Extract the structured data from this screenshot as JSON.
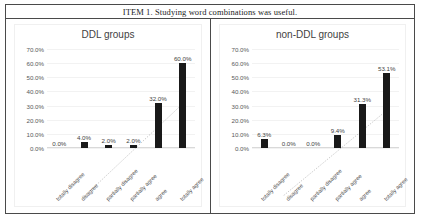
{
  "document": {
    "header_text": "ITEM 1. Studying word combinations was useful."
  },
  "chart_data": [
    {
      "type": "bar",
      "title": "DDL groups",
      "cell": "left",
      "categories": [
        "totally disagree",
        "disagree",
        "partially disagree",
        "partially agree",
        "agree",
        "totally agree"
      ],
      "values": [
        0.0,
        4.0,
        2.0,
        2.0,
        32.0,
        60.0
      ],
      "value_labels": [
        "0.0%",
        "4.0%",
        "2.0%",
        "2.0%",
        "32.0%",
        "60.0%"
      ],
      "ytick_labels": [
        "70.0%",
        "60.0%",
        "50.0%",
        "40.0%",
        "30.0%",
        "20.0%",
        "10.0%",
        "0.0%"
      ],
      "ytick_values": [
        70,
        60,
        50,
        40,
        30,
        20,
        10,
        0
      ],
      "ylim": [
        0,
        70
      ],
      "xlabel": "",
      "ylabel": "",
      "grid": true,
      "legend": "none",
      "bar_color": "#191919",
      "trendline": {
        "style": "dotted",
        "color": "#a6a6a6"
      }
    },
    {
      "type": "bar",
      "title": "non-DDL groups",
      "cell": "right",
      "categories": [
        "totally disagree",
        "disagree",
        "partially disagree",
        "partially agree",
        "agree",
        "totally agree"
      ],
      "values": [
        6.3,
        0.0,
        0.0,
        9.4,
        31.3,
        53.1
      ],
      "value_labels": [
        "6.3%",
        "0.0%",
        "0.0%",
        "9.4%",
        "31.3%",
        "53.1%"
      ],
      "ytick_labels": [
        "70.0%",
        "60.0%",
        "50.0%",
        "40.0%",
        "30.0%",
        "20.0%",
        "10.0%",
        "0.0%"
      ],
      "ytick_values": [
        70,
        60,
        50,
        40,
        30,
        20,
        10,
        0
      ],
      "ylim": [
        0,
        70
      ],
      "xlabel": "",
      "ylabel": "",
      "grid": true,
      "legend": "none",
      "bar_color": "#191919",
      "trendline": {
        "style": "dotted",
        "color": "#a6a6a6"
      }
    }
  ]
}
